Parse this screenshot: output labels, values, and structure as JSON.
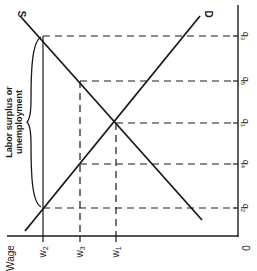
{
  "diagram": {
    "type": "labor-market-supply-demand",
    "orientation": "rotated 90 degrees clockwise",
    "colors": {
      "ink": "#1a1a1a",
      "background": "#ffffff"
    },
    "curves": {
      "supply": {
        "label": "S"
      },
      "demand": {
        "label": "D"
      }
    },
    "wage_axis": {
      "title": "Wage",
      "ticks": [
        "w2",
        "w3",
        "w1"
      ],
      "tick_labels": [
        {
          "base": "w",
          "sub": "2"
        },
        {
          "base": "w",
          "sub": "3"
        },
        {
          "base": "w",
          "sub": "1"
        }
      ]
    },
    "quantity_axis": {
      "origin_label": "0",
      "tick_labels": [
        {
          "base": "q",
          "sub": "3"
        },
        {
          "base": "q",
          "sub": "5"
        },
        {
          "base": "q",
          "sub": "1"
        },
        {
          "base": "q",
          "sub": "4"
        },
        {
          "base": "q",
          "sub": "2"
        }
      ]
    },
    "annotation": {
      "line1": "Labor surplus or",
      "line2": "unemployment"
    }
  }
}
